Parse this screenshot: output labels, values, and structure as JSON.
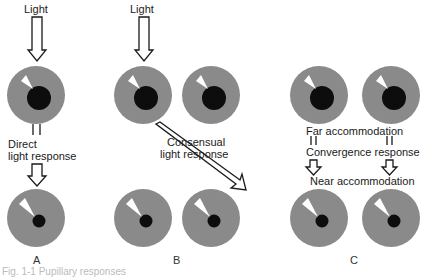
{
  "diagram": {
    "title": "Pupillary responses",
    "colors": {
      "iris": "#8a8a8a",
      "pupil": "#0d0d0d",
      "highlight": "#ffffff",
      "background": "#ffffff",
      "arrow": "#1a1a1a"
    },
    "panels": [
      {
        "id": "A",
        "label": "A",
        "top_label": "Light",
        "middle_label_line1": "Direct",
        "middle_label_line2": "light response",
        "eyes": [
          {
            "position": "top",
            "pupil": "dilated"
          },
          {
            "position": "bottom",
            "pupil": "constricted"
          }
        ]
      },
      {
        "id": "B",
        "label": "B",
        "top_label": "Light",
        "middle_label_line1": "Consensual",
        "middle_label_line2": "light response",
        "eyes": [
          {
            "position": "top-left",
            "pupil": "dilated"
          },
          {
            "position": "top-right",
            "pupil": "dilated"
          },
          {
            "position": "bottom-left",
            "pupil": "constricted"
          },
          {
            "position": "bottom-right",
            "pupil": "constricted"
          }
        ]
      },
      {
        "id": "C",
        "label": "C",
        "label_far": "Far accommodation",
        "label_convergence": "Convergence response",
        "label_near": "Near accommodation",
        "eyes": [
          {
            "position": "top-left",
            "pupil": "dilated"
          },
          {
            "position": "top-right",
            "pupil": "dilated"
          },
          {
            "position": "bottom-left",
            "pupil": "constricted"
          },
          {
            "position": "bottom-right",
            "pupil": "constricted"
          }
        ]
      }
    ],
    "caption": "Fig. 1-1 Pupillary responses"
  }
}
